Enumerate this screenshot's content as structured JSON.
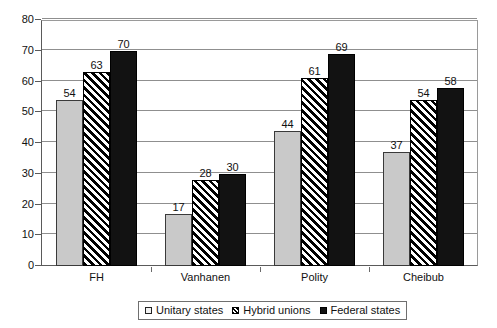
{
  "chart_data": {
    "type": "bar",
    "title": "",
    "subtitle": "",
    "xlabel": "",
    "ylabel": "",
    "categories": [
      "FH",
      "Vanhanen",
      "Polity",
      "Cheibub"
    ],
    "series": [
      {
        "name": "Unitary states",
        "values": [
          54,
          17,
          44,
          37
        ],
        "style": "solid-light-gray"
      },
      {
        "name": "Hybrid unions",
        "values": [
          63,
          28,
          61,
          54
        ],
        "style": "diagonal-hatch"
      },
      {
        "name": "Federal states",
        "values": [
          70,
          30,
          69,
          58
        ],
        "style": "solid-black"
      }
    ],
    "ylim": [
      0,
      80
    ],
    "ytick_step": 10,
    "yticks": [
      0,
      10,
      20,
      30,
      40,
      50,
      60,
      70,
      80
    ],
    "ytick_labels": [
      "0",
      "10",
      "20",
      "30",
      "40",
      "50",
      "60",
      "70",
      "80"
    ],
    "grid": "horizontal",
    "data_labels": true,
    "legend_position": "bottom-center"
  },
  "legend": {
    "items": [
      {
        "label": "Unitary states",
        "swatch": "light-gray-square-icon"
      },
      {
        "label": "Hybrid unions",
        "swatch": "hatched-square-icon"
      },
      {
        "label": "Federal states",
        "swatch": "black-square-icon"
      }
    ]
  },
  "colors": {
    "unitary": "#c9c9c9",
    "hybrid": "#000000",
    "federal": "#121212",
    "gridline": "#8f8f8f",
    "axis": "#5a5a5a",
    "text": "#111111",
    "background": "#ffffff"
  }
}
